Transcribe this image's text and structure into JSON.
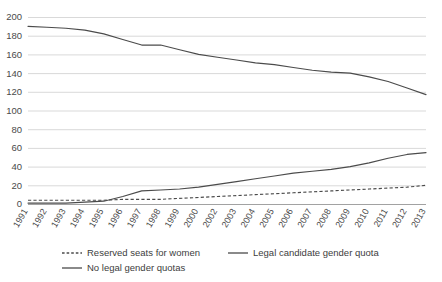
{
  "chart_data": {
    "type": "line",
    "title": "",
    "subtitle": "",
    "xlabel": "",
    "ylabel": "",
    "ylim": [
      0,
      200
    ],
    "ytick_step": 20,
    "yticks": [
      0,
      20,
      40,
      60,
      80,
      100,
      120,
      140,
      160,
      180,
      200
    ],
    "grid": true,
    "legend_position": "bottom",
    "categories": [
      "1991",
      "1992",
      "1993",
      "1994",
      "1995",
      "1996",
      "1997",
      "1998",
      "1999",
      "2000",
      "2002",
      "2003",
      "2004",
      "2005",
      "2006",
      "2007",
      "2008",
      "2009",
      "2010",
      "2011",
      "2012",
      "2013"
    ],
    "series": [
      {
        "name": "Reserved seats for women",
        "style": "dashed",
        "color": "#4b4b4b",
        "values": [
          4,
          4,
          4,
          4,
          4,
          5,
          5,
          5,
          6,
          7,
          8,
          9,
          10,
          11,
          12,
          13,
          14,
          15,
          16,
          17,
          18,
          20
        ]
      },
      {
        "name": "Legal candidate gender quota",
        "style": "solid",
        "color": "#4b4b4b",
        "values": [
          1,
          1,
          1,
          2,
          3,
          8,
          14,
          15,
          16,
          18,
          21,
          24,
          27,
          30,
          33,
          35,
          37,
          40,
          44,
          49,
          53,
          55
        ]
      },
      {
        "name": "No legal gender quotas",
        "style": "solid",
        "color": "#4b4b4b",
        "values": [
          190,
          189,
          188,
          186,
          182,
          176,
          170,
          170,
          165,
          160,
          157,
          154,
          151,
          149,
          146,
          143,
          141,
          140,
          136,
          131,
          124,
          117
        ]
      }
    ]
  },
  "legend": {
    "items": [
      {
        "label": "Reserved seats for women",
        "style": "dashed"
      },
      {
        "label": "Legal candidate gender quota",
        "style": "solid"
      },
      {
        "label": "No legal gender quotas",
        "style": "solid"
      }
    ]
  }
}
